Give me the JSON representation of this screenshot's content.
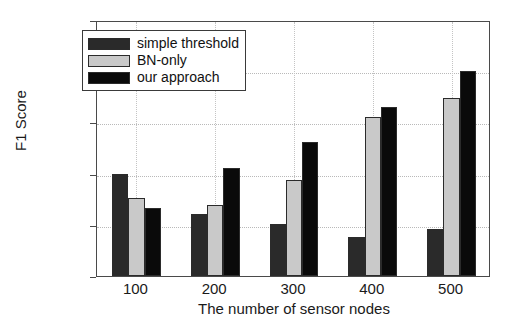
{
  "chart_data": {
    "type": "bar",
    "title": "",
    "xlabel": "The number of sensor nodes",
    "ylabel": "F1 Score",
    "categories": [
      "100",
      "200",
      "300",
      "400",
      "500"
    ],
    "series": [
      {
        "name": "simple threshold",
        "color": "#2a2a2a",
        "values": [
          0.7,
          0.622,
          0.602,
          0.577,
          0.592
        ]
      },
      {
        "name": "BN-only",
        "color": "#c9c9c9",
        "values": [
          0.653,
          0.638,
          0.688,
          0.81,
          0.847
        ]
      },
      {
        "name": "our approach",
        "color": "#0a0a0a",
        "values": [
          0.633,
          0.71,
          0.762,
          0.83,
          0.9
        ]
      }
    ],
    "ylim": [
      0.5,
      1.0
    ],
    "yticks": [
      "0.5",
      "0.6",
      "0.7",
      "0.8",
      "0.9",
      "1"
    ],
    "ytick_values": [
      0.5,
      0.6,
      0.7,
      0.8,
      0.9,
      1.0
    ],
    "grid": true,
    "legend_position": "top-left"
  }
}
